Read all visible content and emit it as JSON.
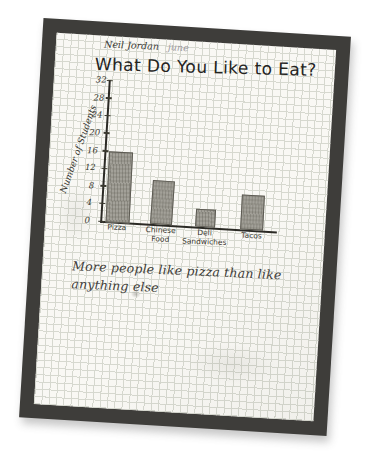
{
  "header": {
    "student_name": "Neil Jordan",
    "pencil_note": "june"
  },
  "chart_data": {
    "type": "bar",
    "title": "What Do You Like to Eat?",
    "categories": [
      "Pizza",
      "Chinese Food",
      "Deli Sandwiches",
      "Tacos"
    ],
    "values": [
      16,
      10,
      4,
      8
    ],
    "ylabel": "Number of Students",
    "xlabel": "",
    "ylim": [
      0,
      32
    ],
    "yticks": [
      32,
      28,
      24,
      20,
      16,
      12,
      8,
      4,
      0
    ],
    "grid": true,
    "legend": false,
    "annotation": "More people like pizza than like anything else",
    "annotation_lines": [
      "More people like pizza than like",
      "anything else"
    ]
  },
  "colors": {
    "background": "#ffffff",
    "mat": "#3e3d3a",
    "paper": "#f9f8f4",
    "grid_line": "#d6d8cf",
    "ink": "#25241f",
    "pencil_bar_fill": "#a3a199",
    "pencil_bar_outline": "#5c5a52",
    "pencil_note": "#9a99a0"
  }
}
